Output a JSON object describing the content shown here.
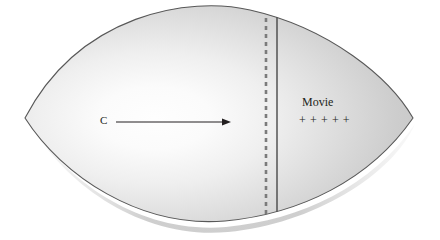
{
  "figure": {
    "name": "lens-shaded-diagram",
    "background_color": "#ffffff",
    "shape": {
      "type": "lens",
      "fill_light": "#fdfdfd",
      "fill_mid": "#d9d9d9",
      "fill_dark": "#bfbfbf",
      "outline_color": "#555555",
      "shadow_color": "#c9c9c9",
      "left_tip_x": 25,
      "right_tip_x": 413,
      "center_y": 118,
      "top_y": 13,
      "bottom_y": 221
    },
    "highlight": {
      "center_x": 150,
      "center_y": 120,
      "description": "bright-radial-highlight"
    }
  },
  "annotations": {
    "vector_label": "C",
    "region_label": "Movie",
    "plus_marks": "+ + + + +",
    "plus_count": 5
  },
  "arrow": {
    "name": "direction-arrow",
    "start_x": 116,
    "start_y": 122,
    "end_x": 231,
    "end_y": 122,
    "color": "#231f20"
  },
  "dashed_line": {
    "name": "dashed-boundary-line",
    "x": 266,
    "top_y": 22,
    "bottom_y": 214,
    "color": "#777777",
    "dash_length": 4,
    "gap_length": 4
  },
  "solid_line": {
    "name": "solid-boundary-line",
    "x": 277,
    "top_y": 18,
    "bottom_y": 219,
    "color": "#3a3a3a"
  }
}
